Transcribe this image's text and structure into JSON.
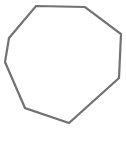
{
  "shape": {
    "type": "octagon",
    "points": "36,6 85,7 121,34 119,78 69,123 25,108 5,62 9,38",
    "stroke": "#727272",
    "fill": "#ffffff",
    "stroke_width": "2.2"
  }
}
